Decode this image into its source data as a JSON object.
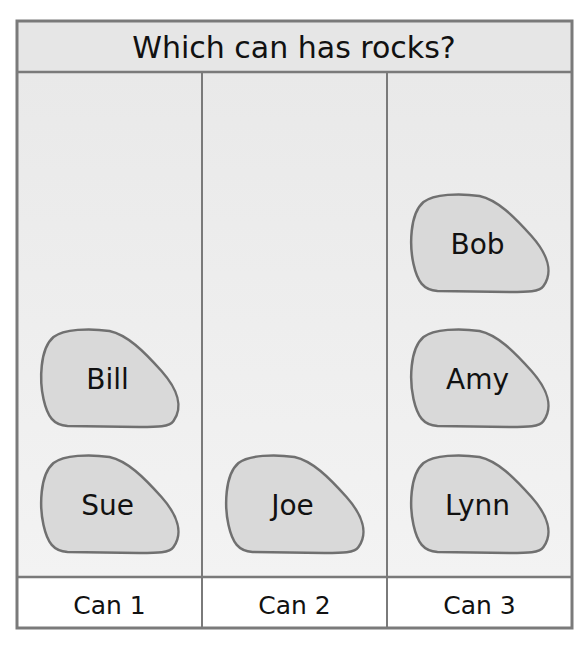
{
  "chart_data": {
    "type": "pictograph",
    "title": "Which can has rocks?",
    "categories": [
      "Can 1",
      "Can 2",
      "Can 3"
    ],
    "values": [
      2,
      1,
      3
    ],
    "items": [
      [
        "Sue",
        "Bill"
      ],
      [
        "Joe"
      ],
      [
        "Lynn",
        "Amy",
        "Bob"
      ]
    ],
    "max_per_column": 4,
    "colors": {
      "border": "#7a7a7a",
      "header_bg": "#e6e6e6",
      "body_bg": "#efefef",
      "label_bg": "#ffffff",
      "rock_fill": "#d9d9d9",
      "rock_stroke": "#707070"
    }
  }
}
